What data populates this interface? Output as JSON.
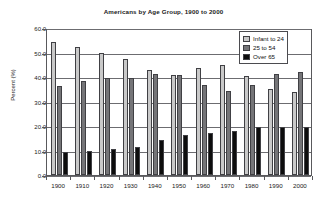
{
  "chart_data": {
    "type": "bar",
    "title": "Americans by Age Group, 1900 to 2000",
    "xlabel": "",
    "ylabel": "Percent (%)",
    "ylim": [
      0,
      60
    ],
    "ytick_labels": [
      "0.0",
      "10.0",
      "20.0",
      "30.0",
      "40.0",
      "50.0",
      "60.0"
    ],
    "ytick_values": [
      0,
      10,
      20,
      30,
      40,
      50,
      60
    ],
    "grid": true,
    "legend_position": "top-right",
    "categories": [
      "1900",
      "1910",
      "1920",
      "1930",
      "1940",
      "1950",
      "1960",
      "1970",
      "1980",
      "1990",
      "2000"
    ],
    "series": [
      {
        "name": "Infant to 24",
        "color": "#c9c9c9",
        "values": [
          54.2,
          52.1,
          49.8,
          47.5,
          42.8,
          40.8,
          43.7,
          45.1,
          40.4,
          35.2,
          34.0
        ]
      },
      {
        "name": "25 to 54",
        "color": "#757578",
        "values": [
          36.5,
          38.4,
          39.7,
          39.7,
          41.3,
          40.7,
          36.8,
          34.1,
          36.8,
          41.3,
          42.2
        ]
      },
      {
        "name": "Over 65",
        "color": "#0d0d0d",
        "values": [
          9.5,
          9.9,
          10.5,
          11.6,
          14.2,
          16.2,
          17.0,
          17.9,
          19.5,
          19.5,
          19.4
        ]
      }
    ]
  }
}
